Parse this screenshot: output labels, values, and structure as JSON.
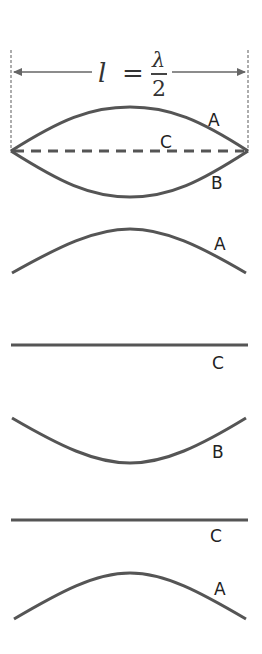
{
  "formula": {
    "lhs": "l",
    "equals": "=",
    "numerator": "λ",
    "denominator": "2"
  },
  "colors": {
    "curve": "#555555",
    "guide": "#777777",
    "label": "#222222"
  },
  "top_panel": {
    "labels": {
      "A": "A",
      "B": "B",
      "C": "C"
    },
    "description": "Superimposed positions A (crest), C (dashed equilibrium), B (trough) between fixed ends"
  },
  "sequence": [
    {
      "label": "A",
      "shape": "crest"
    },
    {
      "label": "C",
      "shape": "flat"
    },
    {
      "label": "B",
      "shape": "trough"
    },
    {
      "label": "C",
      "shape": "flat"
    },
    {
      "label": "A",
      "shape": "crest"
    }
  ]
}
